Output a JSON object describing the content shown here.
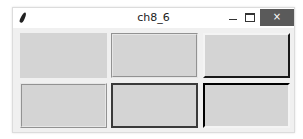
{
  "window": {
    "title": "ch8_6",
    "controls": {
      "minimize_icon": "minimize-icon",
      "maximize_icon": "maximize-icon",
      "close_label": "×"
    },
    "app_icon": "feather-icon"
  },
  "frames": [
    {
      "relief": "flat",
      "row": 1,
      "col": 1
    },
    {
      "relief": "groove",
      "row": 1,
      "col": 2
    },
    {
      "relief": "raised",
      "row": 1,
      "col": 3
    },
    {
      "relief": "ridge",
      "row": 2,
      "col": 1
    },
    {
      "relief": "solid",
      "row": 2,
      "col": 2
    },
    {
      "relief": "sunken",
      "row": 2,
      "col": 3
    }
  ],
  "colors": {
    "frame_bg": "#d4d4d4",
    "window_bg": "#f0f0f0",
    "close_button_bg": "#5a5a5a"
  }
}
